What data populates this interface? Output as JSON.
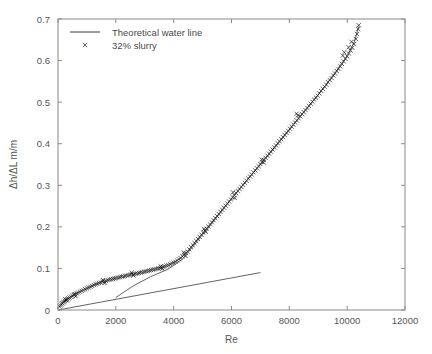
{
  "chart_data": {
    "type": "scatter",
    "title": "",
    "xlabel": "Re",
    "ylabel": "Δh/ΔL m/m",
    "xlim": [
      0,
      12000
    ],
    "ylim": [
      0,
      0.7
    ],
    "xticks": [
      0,
      2000,
      4000,
      6000,
      8000,
      10000,
      12000
    ],
    "yticks": [
      0,
      0.1,
      0.2,
      0.3,
      0.4,
      0.5,
      0.6,
      0.7
    ],
    "xticklabels": [
      "0",
      "2000",
      "4000",
      "6000",
      "8000",
      "10000",
      "12000"
    ],
    "yticklabels": [
      "0",
      "0.1",
      "0.2",
      "0.3",
      "0.4",
      "0.5",
      "0.6",
      "0.7"
    ],
    "grid": false,
    "legend_position": "upper left",
    "legend": [
      {
        "label": "Theoretical water line",
        "marker": "line",
        "color": "#3a3a3a"
      },
      {
        "label": "32% slurry",
        "marker": "x",
        "color": "#1a1a1a"
      }
    ],
    "series": [
      {
        "name": "32% slurry",
        "marker": "x",
        "type": "scatter",
        "points": [
          [
            60,
            0.008
          ],
          [
            90,
            0.011
          ],
          [
            120,
            0.014
          ],
          [
            150,
            0.016
          ],
          [
            180,
            0.018
          ],
          [
            210,
            0.02
          ],
          [
            240,
            0.022
          ],
          [
            280,
            0.024
          ],
          [
            320,
            0.026
          ],
          [
            360,
            0.028
          ],
          [
            400,
            0.03
          ],
          [
            450,
            0.032
          ],
          [
            500,
            0.034
          ],
          [
            550,
            0.036
          ],
          [
            600,
            0.038
          ],
          [
            650,
            0.04
          ],
          [
            700,
            0.042
          ],
          [
            760,
            0.044
          ],
          [
            820,
            0.046
          ],
          [
            880,
            0.048
          ],
          [
            940,
            0.05
          ],
          [
            1000,
            0.052
          ],
          [
            1060,
            0.054
          ],
          [
            1120,
            0.056
          ],
          [
            1180,
            0.058
          ],
          [
            1240,
            0.06
          ],
          [
            1300,
            0.062
          ],
          [
            1360,
            0.063
          ],
          [
            1420,
            0.065
          ],
          [
            1480,
            0.066
          ],
          [
            1540,
            0.068
          ],
          [
            1600,
            0.069
          ],
          [
            1660,
            0.07
          ],
          [
            1720,
            0.072
          ],
          [
            1780,
            0.073
          ],
          [
            1840,
            0.074
          ],
          [
            1900,
            0.075
          ],
          [
            1960,
            0.076
          ],
          [
            2020,
            0.077
          ],
          [
            2080,
            0.078
          ],
          [
            2140,
            0.079
          ],
          [
            2200,
            0.08
          ],
          [
            2260,
            0.081
          ],
          [
            2320,
            0.082
          ],
          [
            2380,
            0.083
          ],
          [
            2440,
            0.084
          ],
          [
            2500,
            0.085
          ],
          [
            2560,
            0.086
          ],
          [
            2620,
            0.086
          ],
          [
            2680,
            0.087
          ],
          [
            2740,
            0.088
          ],
          [
            2800,
            0.089
          ],
          [
            2860,
            0.09
          ],
          [
            2920,
            0.091
          ],
          [
            2980,
            0.092
          ],
          [
            3040,
            0.093
          ],
          [
            3100,
            0.094
          ],
          [
            3160,
            0.095
          ],
          [
            3220,
            0.096
          ],
          [
            3280,
            0.097
          ],
          [
            3340,
            0.098
          ],
          [
            3400,
            0.099
          ],
          [
            3460,
            0.1
          ],
          [
            3520,
            0.101
          ],
          [
            3580,
            0.102
          ],
          [
            3640,
            0.104
          ],
          [
            3700,
            0.105
          ],
          [
            3760,
            0.107
          ],
          [
            3820,
            0.108
          ],
          [
            3880,
            0.11
          ],
          [
            3940,
            0.112
          ],
          [
            4000,
            0.114
          ],
          [
            4060,
            0.116
          ],
          [
            4120,
            0.119
          ],
          [
            4180,
            0.122
          ],
          [
            4240,
            0.125
          ],
          [
            4300,
            0.129
          ],
          [
            4360,
            0.133
          ],
          [
            4420,
            0.137
          ],
          [
            4480,
            0.141
          ],
          [
            4540,
            0.146
          ],
          [
            4600,
            0.151
          ],
          [
            4660,
            0.156
          ],
          [
            4720,
            0.161
          ],
          [
            4780,
            0.166
          ],
          [
            4840,
            0.171
          ],
          [
            4900,
            0.176
          ],
          [
            4960,
            0.181
          ],
          [
            5020,
            0.186
          ],
          [
            5080,
            0.191
          ],
          [
            5140,
            0.196
          ],
          [
            5200,
            0.201
          ],
          [
            5260,
            0.206
          ],
          [
            5320,
            0.211
          ],
          [
            5380,
            0.216
          ],
          [
            5440,
            0.221
          ],
          [
            5500,
            0.226
          ],
          [
            5560,
            0.231
          ],
          [
            5620,
            0.236
          ],
          [
            5680,
            0.241
          ],
          [
            5740,
            0.246
          ],
          [
            5800,
            0.251
          ],
          [
            5860,
            0.256
          ],
          [
            5920,
            0.261
          ],
          [
            5980,
            0.266
          ],
          [
            6040,
            0.271
          ],
          [
            6100,
            0.276
          ],
          [
            6160,
            0.281
          ],
          [
            6220,
            0.286
          ],
          [
            6280,
            0.291
          ],
          [
            6340,
            0.296
          ],
          [
            6400,
            0.301
          ],
          [
            6460,
            0.306
          ],
          [
            6520,
            0.311
          ],
          [
            6580,
            0.316
          ],
          [
            6640,
            0.321
          ],
          [
            6700,
            0.326
          ],
          [
            6760,
            0.331
          ],
          [
            6820,
            0.336
          ],
          [
            6880,
            0.341
          ],
          [
            6940,
            0.346
          ],
          [
            7000,
            0.351
          ],
          [
            7060,
            0.356
          ],
          [
            7120,
            0.361
          ],
          [
            7180,
            0.366
          ],
          [
            7240,
            0.371
          ],
          [
            7300,
            0.376
          ],
          [
            7360,
            0.381
          ],
          [
            7420,
            0.386
          ],
          [
            7480,
            0.391
          ],
          [
            7540,
            0.396
          ],
          [
            7600,
            0.401
          ],
          [
            7660,
            0.406
          ],
          [
            7720,
            0.411
          ],
          [
            7780,
            0.416
          ],
          [
            7840,
            0.421
          ],
          [
            7900,
            0.426
          ],
          [
            7960,
            0.431
          ],
          [
            8020,
            0.436
          ],
          [
            8080,
            0.441
          ],
          [
            8140,
            0.446
          ],
          [
            8200,
            0.451
          ],
          [
            8260,
            0.456
          ],
          [
            8320,
            0.461
          ],
          [
            8380,
            0.466
          ],
          [
            8440,
            0.471
          ],
          [
            8500,
            0.476
          ],
          [
            8560,
            0.481
          ],
          [
            8620,
            0.486
          ],
          [
            8680,
            0.491
          ],
          [
            8740,
            0.496
          ],
          [
            8800,
            0.501
          ],
          [
            8860,
            0.506
          ],
          [
            8920,
            0.511
          ],
          [
            8980,
            0.516
          ],
          [
            9040,
            0.521
          ],
          [
            9100,
            0.527
          ],
          [
            9160,
            0.532
          ],
          [
            9220,
            0.537
          ],
          [
            9280,
            0.542
          ],
          [
            9340,
            0.548
          ],
          [
            9400,
            0.553
          ],
          [
            9460,
            0.558
          ],
          [
            9520,
            0.564
          ],
          [
            9580,
            0.569
          ],
          [
            9640,
            0.575
          ],
          [
            9700,
            0.58
          ],
          [
            9760,
            0.586
          ],
          [
            9820,
            0.592
          ],
          [
            9880,
            0.598
          ],
          [
            9940,
            0.604
          ],
          [
            10000,
            0.61
          ],
          [
            10060,
            0.617
          ],
          [
            10120,
            0.624
          ],
          [
            10180,
            0.631
          ],
          [
            10240,
            0.64
          ],
          [
            10300,
            0.652
          ],
          [
            10340,
            0.664
          ],
          [
            10380,
            0.676
          ],
          [
            10400,
            0.685
          ],
          [
            9850,
            0.612
          ],
          [
            9900,
            0.62
          ],
          [
            10050,
            0.632
          ],
          [
            10150,
            0.645
          ],
          [
            8250,
            0.472
          ],
          [
            8300,
            0.468
          ],
          [
            7050,
            0.362
          ],
          [
            7110,
            0.355
          ],
          [
            6050,
            0.283
          ],
          [
            6110,
            0.27
          ],
          [
            5050,
            0.195
          ],
          [
            5110,
            0.188
          ],
          [
            4350,
            0.138
          ],
          [
            4410,
            0.13
          ],
          [
            3550,
            0.105
          ],
          [
            3610,
            0.099
          ],
          [
            2550,
            0.09
          ],
          [
            2610,
            0.083
          ],
          [
            1550,
            0.072
          ],
          [
            1610,
            0.065
          ],
          [
            550,
            0.038
          ],
          [
            610,
            0.033
          ],
          [
            250,
            0.026
          ],
          [
            310,
            0.023
          ]
        ]
      },
      {
        "name": "slurry trend line",
        "type": "line",
        "points": [
          [
            2000,
            0.03
          ],
          [
            2600,
            0.058
          ],
          [
            3200,
            0.08
          ],
          [
            3800,
            0.098
          ],
          [
            4300,
            0.122
          ],
          [
            4800,
            0.164
          ],
          [
            5400,
            0.215
          ],
          [
            6000,
            0.268
          ],
          [
            6600,
            0.318
          ],
          [
            7200,
            0.366
          ],
          [
            7800,
            0.416
          ],
          [
            8400,
            0.468
          ],
          [
            9000,
            0.518
          ],
          [
            9600,
            0.572
          ],
          [
            10000,
            0.612
          ],
          [
            10250,
            0.645
          ],
          [
            10400,
            0.682
          ]
        ]
      },
      {
        "name": "Theoretical water line",
        "type": "line",
        "points": [
          [
            0,
            0.0
          ],
          [
            7000,
            0.09
          ]
        ]
      }
    ]
  }
}
